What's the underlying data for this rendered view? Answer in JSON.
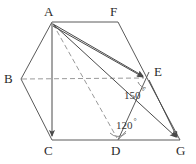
{
  "figure": {
    "stroke_color": "#555555",
    "dash_color": "#999999",
    "background": "#ffffff",
    "width": 196,
    "height": 164,
    "vertices": [
      {
        "id": "A",
        "label": "A",
        "x": 52,
        "y": 22,
        "label_x": 46,
        "label_y": 8
      },
      {
        "id": "F",
        "label": "F",
        "x": 118,
        "y": 22,
        "label_x": 112,
        "label_y": 8
      },
      {
        "id": "B",
        "label": "B",
        "x": 21,
        "y": 79,
        "label_x": 5,
        "label_y": 74
      },
      {
        "id": "E",
        "label": "E",
        "x": 147,
        "y": 78,
        "label_x": 155,
        "label_y": 68
      },
      {
        "id": "C",
        "label": "C",
        "x": 52,
        "y": 140,
        "label_x": 45,
        "label_y": 145
      },
      {
        "id": "D",
        "label": "D",
        "x": 118,
        "y": 140,
        "label_x": 112,
        "label_y": 145
      },
      {
        "id": "G",
        "label": "G",
        "x": 180,
        "y": 140,
        "label_x": 177,
        "label_y": 145
      }
    ],
    "edges": [
      {
        "from": "A",
        "to": "F",
        "style": "solid",
        "arrow": false
      },
      {
        "from": "A",
        "to": "B",
        "style": "solid",
        "arrow": false
      },
      {
        "from": "B",
        "to": "C",
        "style": "solid",
        "arrow": false
      },
      {
        "from": "C",
        "to": "D",
        "style": "solid",
        "arrow": false
      },
      {
        "from": "D",
        "to": "G",
        "style": "solid",
        "arrow": false
      },
      {
        "from": "F",
        "to": "E",
        "style": "solid",
        "arrow": false
      },
      {
        "from": "E",
        "to": "G",
        "style": "solid",
        "arrow": false
      },
      {
        "from": "D",
        "to": "E",
        "style": "solid",
        "arrow": false
      },
      {
        "from": "B",
        "to": "E",
        "style": "dashed",
        "arrow": false
      },
      {
        "from": "A",
        "to": "D",
        "style": "dashed",
        "arrow": false
      }
    ],
    "vectors": [
      {
        "from": "A",
        "to": "C",
        "label": ""
      },
      {
        "from": "A",
        "to": "E",
        "label": ""
      },
      {
        "from": "A",
        "to": "G",
        "label": ""
      }
    ],
    "angles": [
      {
        "id": "angle-at-e",
        "value": "150",
        "degree_symbol": "°",
        "x": 124,
        "y": 90,
        "vertex": "E"
      },
      {
        "id": "angle-at-d",
        "value": "120",
        "degree_symbol": "°",
        "x": 117,
        "y": 120,
        "vertex": "D"
      }
    ],
    "angle_arcs": [
      {
        "id": "arc-e",
        "cx": 147,
        "cy": 78,
        "r": 9
      },
      {
        "id": "arc-d",
        "cx": 118,
        "cy": 140,
        "r": 9
      }
    ]
  }
}
